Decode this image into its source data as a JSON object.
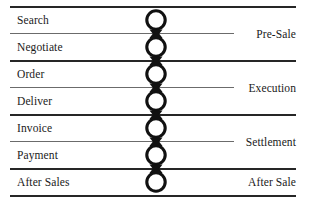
{
  "diagram": {
    "orientation": "vertical-chain",
    "node_shape": "circle",
    "connector": "arrowhead",
    "colors": {
      "line_thick": "#262626",
      "line_thin": "#6b6b6b",
      "node_stroke": "#111111",
      "node_fill": "#ffffff",
      "text": "#1a1a1a",
      "background": "#ffffff"
    },
    "steps": [
      {
        "id": "search",
        "label": "Search"
      },
      {
        "id": "negotiate",
        "label": "Negotiate"
      },
      {
        "id": "order",
        "label": "Order"
      },
      {
        "id": "deliver",
        "label": "Deliver"
      },
      {
        "id": "invoice",
        "label": "Invoice"
      },
      {
        "id": "payment",
        "label": "Payment"
      },
      {
        "id": "after-sales",
        "label": "After Sales"
      }
    ],
    "groups": [
      {
        "id": "pre-sale",
        "label": "Pre-Sale",
        "steps": [
          "search",
          "negotiate"
        ]
      },
      {
        "id": "execution",
        "label": "Execution",
        "steps": [
          "order",
          "deliver"
        ]
      },
      {
        "id": "settlement",
        "label": "Settlement",
        "steps": [
          "invoice",
          "payment"
        ]
      },
      {
        "id": "after-sale",
        "label": "After Sale",
        "steps": [
          "after-sales"
        ]
      }
    ]
  }
}
